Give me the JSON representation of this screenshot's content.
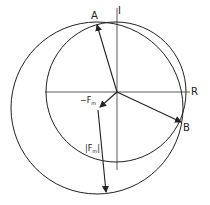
{
  "diagram": {
    "axes": {
      "horizontal_label": "R",
      "vertical_label": "I"
    },
    "points": {
      "A": "A",
      "B": "B"
    },
    "vectors": {
      "neg_fm_label": "−F",
      "neg_fm_subscript": "m",
      "abs_fm_label_open": "|F",
      "abs_fm_subscript": "m",
      "abs_fm_label_close": "|"
    },
    "colors": {
      "stroke": "#222222",
      "background": "#ffffff"
    }
  }
}
